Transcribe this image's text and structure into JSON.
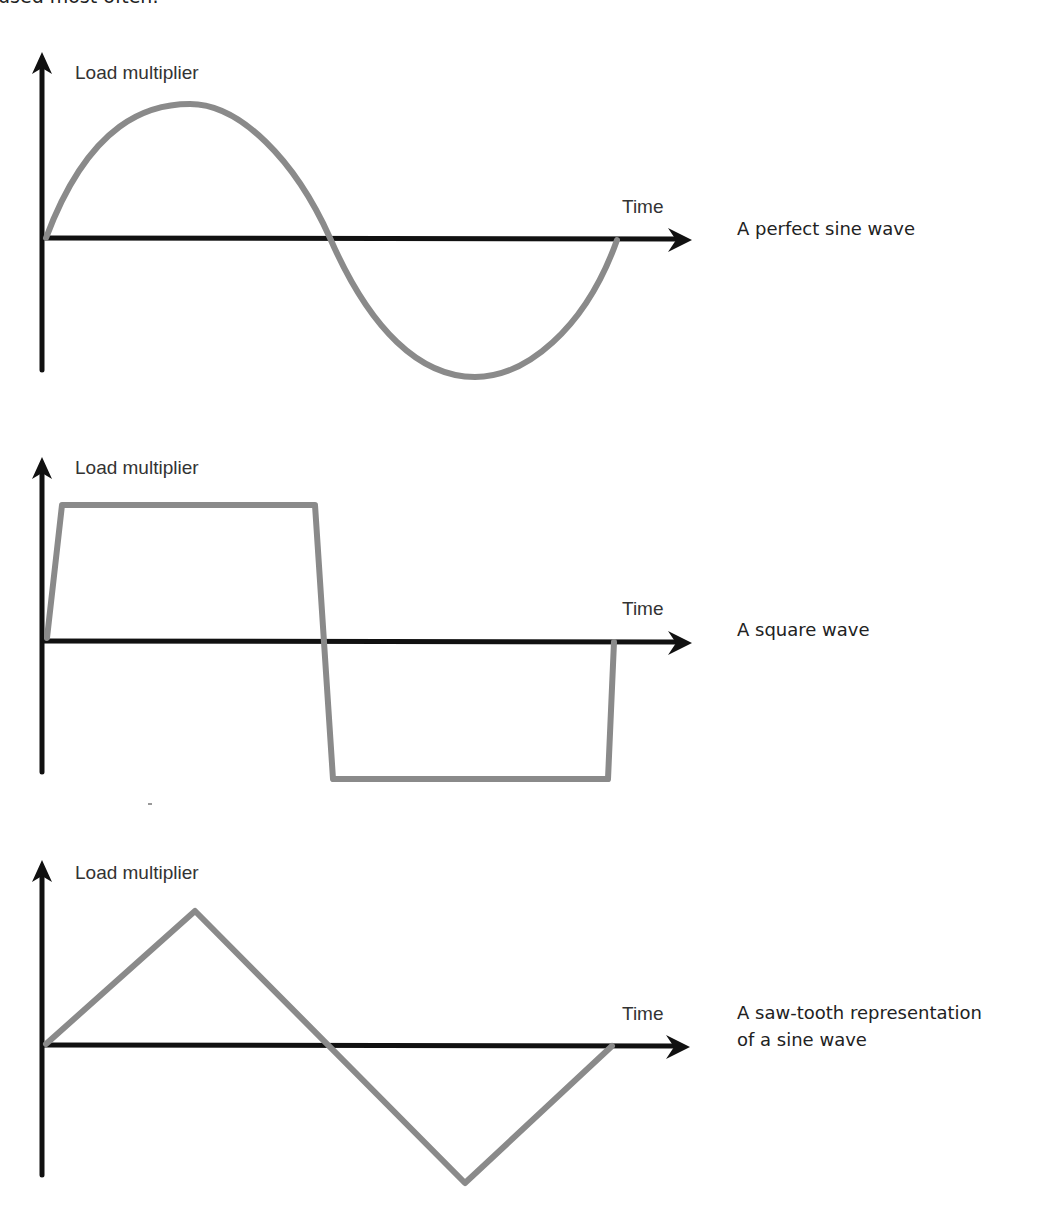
{
  "page": {
    "top_caption": "used most often."
  },
  "diagrams": [
    {
      "id": "sine",
      "y_label": "Load multiplier",
      "x_label": "Time",
      "caption_lines": [
        "A perfect sine wave"
      ],
      "wave_type": "sine"
    },
    {
      "id": "square",
      "y_label": "Load multiplier",
      "x_label": "Time",
      "caption_lines": [
        "A square wave"
      ],
      "wave_type": "square"
    },
    {
      "id": "sawtooth",
      "y_label": "Load multiplier",
      "x_label": "Time",
      "caption_lines": [
        "A saw-tooth representation",
        "of a sine wave"
      ],
      "wave_type": "triangle"
    }
  ],
  "colors": {
    "axis": "#111111",
    "wave": "#8a8a8a",
    "text": "#333333"
  }
}
